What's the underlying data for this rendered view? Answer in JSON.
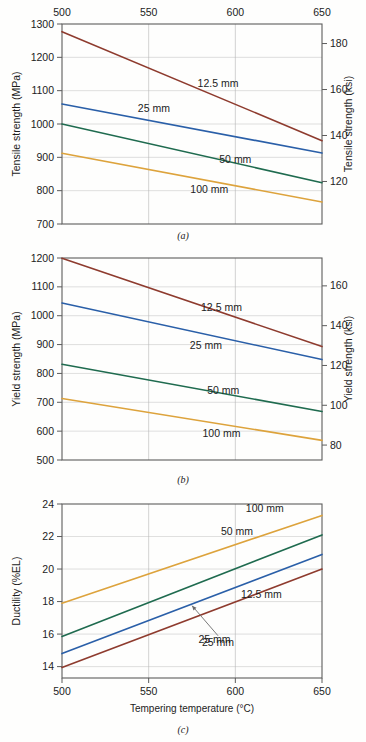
{
  "figure": {
    "panel_a_caption": "(a)",
    "panel_b_caption": "(b)",
    "panel_c_caption": "(c)"
  },
  "chart_data": [
    {
      "id": "a",
      "type": "line",
      "title": "",
      "xlabel": "",
      "ylabel": "Tensile strength (MPa)",
      "y2label": "Tensile strength (ksi)",
      "xlim": [
        500,
        650
      ],
      "ylim": [
        700,
        1300
      ],
      "y2lim": [
        101.5,
        188.5
      ],
      "xticks": [
        500,
        550,
        600,
        650
      ],
      "yticks": [
        700,
        800,
        900,
        1000,
        1100,
        1200,
        1300
      ],
      "y2ticks": [
        120,
        140,
        160,
        180
      ],
      "xtick_labels": [
        "500",
        "550",
        "600",
        "650"
      ],
      "ytick_labels": [
        "700",
        "800",
        "900",
        "1000",
        "1100",
        "1200",
        "1300"
      ],
      "y2tick_labels": [
        "120",
        "140",
        "160",
        "180"
      ],
      "x_axis_position": "top",
      "grid": true,
      "legend_position": "inline-annotations",
      "x": [
        500,
        650
      ],
      "series": [
        {
          "name": "12.5 mm",
          "color": "#8e3b2e",
          "values": [
            1277,
            950
          ],
          "label_x": 590,
          "label_y": 1110
        },
        {
          "name": "25 mm",
          "color": "#2a5fa8",
          "values": [
            1060,
            913
          ],
          "label_x": 553,
          "label_y": 1037
        },
        {
          "name": "50 mm",
          "color": "#1f6b4f",
          "values": [
            1000,
            824
          ],
          "label_x": 600,
          "label_y": 882
        },
        {
          "name": "100 mm",
          "color": "#dda33c",
          "values": [
            912,
            766
          ],
          "label_x": 585,
          "label_y": 793
        }
      ]
    },
    {
      "id": "b",
      "type": "line",
      "title": "",
      "xlabel": "",
      "ylabel": "Yield strength (MPa)",
      "y2label": "Yield strength (ksi)",
      "xlim": [
        500,
        650
      ],
      "ylim": [
        500,
        1200
      ],
      "y2lim": [
        72.5,
        174
      ],
      "xticks": [
        500,
        550,
        600,
        650
      ],
      "yticks": [
        500,
        600,
        700,
        800,
        900,
        1000,
        1100,
        1200
      ],
      "y2ticks": [
        80,
        100,
        120,
        140,
        160
      ],
      "xtick_labels": [
        "500",
        "550",
        "600",
        "650"
      ],
      "ytick_labels": [
        "500",
        "600",
        "700",
        "800",
        "900",
        "1000",
        "1100",
        "1200"
      ],
      "y2tick_labels": [
        "80",
        "100",
        "120",
        "140",
        "160"
      ],
      "x_axis_position": "none",
      "grid": true,
      "legend_position": "inline-annotations",
      "x": [
        500,
        650
      ],
      "series": [
        {
          "name": "12.5 mm",
          "color": "#8e3b2e",
          "values": [
            1199,
            893
          ],
          "label_x": 592,
          "label_y": 1015
        },
        {
          "name": "25 mm",
          "color": "#2a5fa8",
          "values": [
            1044,
            848
          ],
          "label_x": 583,
          "label_y": 886
        },
        {
          "name": "50 mm",
          "color": "#1f6b4f",
          "values": [
            832,
            668
          ],
          "label_x": 593,
          "label_y": 729
        },
        {
          "name": "100 mm",
          "color": "#dda33c",
          "values": [
            713,
            568
          ],
          "label_x": 592,
          "label_y": 578
        }
      ]
    },
    {
      "id": "c",
      "type": "line",
      "title": "",
      "xlabel": "Tempering temperature (°C)",
      "ylabel": "Ductility (%EL)",
      "y2label": "",
      "xlim": [
        500,
        650
      ],
      "ylim": [
        13.3,
        24
      ],
      "xticks": [
        500,
        550,
        600,
        650
      ],
      "yticks": [
        14,
        16,
        18,
        20,
        22,
        24
      ],
      "xtick_labels": [
        "500",
        "550",
        "600",
        "650"
      ],
      "ytick_labels": [
        "14",
        "16",
        "18",
        "20",
        "22",
        "24"
      ],
      "x_axis_position": "bottom",
      "grid": true,
      "legend_position": "inline-annotations",
      "x": [
        500,
        650
      ],
      "series": [
        {
          "name": "100 mm",
          "color": "#dda33c",
          "values": [
            17.9,
            23.3
          ],
          "label_x": 617,
          "label_y": 23.5
        },
        {
          "name": "50 mm",
          "color": "#1f6b4f",
          "values": [
            15.85,
            22.1
          ],
          "label_x": 601,
          "label_y": 22.1
        },
        {
          "name": "25 mm",
          "color": "#2a5fa8",
          "values": [
            14.8,
            20.9
          ],
          "label_x": 588,
          "label_y": 15.45
        },
        {
          "name": "12.5 mm",
          "color": "#8e3b2e",
          "values": [
            13.95,
            20.0
          ],
          "label_x": 615,
          "label_y": 18.2
        }
      ],
      "annotations": [
        {
          "name": "callout-25mm",
          "text": "25 mm",
          "arrow_from_x": 590,
          "arrow_from_y": 15.9,
          "arrow_to_x": 575,
          "arrow_to_y": 17.75
        }
      ]
    }
  ],
  "colors": {
    "series_12_5mm": "#8e3b2e",
    "series_25mm": "#2a5fa8",
    "series_50mm": "#1f6b4f",
    "series_100mm": "#dda33c",
    "axis": "#5c5c5c",
    "grid": "#c9c9c9",
    "background": "#fefefd"
  }
}
